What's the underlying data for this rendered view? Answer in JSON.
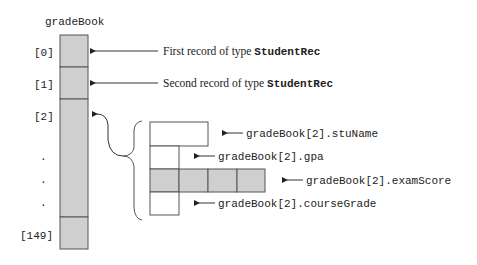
{
  "array": {
    "name": "gradeBook",
    "index_labels": [
      "[0]",
      "[1]",
      "[2]",
      ".",
      ".",
      ".",
      "[149]"
    ],
    "cell_color": "#cfcfcf"
  },
  "annotations": {
    "record0_prefix": "First record of type ",
    "record0_type": "StudentRec",
    "record1_prefix": "Second record of type ",
    "record1_type": "StudentRec"
  },
  "struct_fields": {
    "stuName": "gradeBook[2].stuName",
    "gpa": "gradeBook[2].gpa",
    "examScore": "gradeBook[2].examScore",
    "courseGrade": "gradeBook[2].courseGrade",
    "examScore_cells": 4
  }
}
